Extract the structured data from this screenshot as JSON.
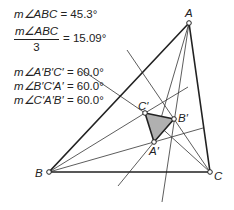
{
  "measurements": {
    "angle_abc": {
      "label": "m∠ABC",
      "value": "= 45.3°"
    },
    "angle_abc_third": {
      "numerator": "m∠ABC",
      "denominator": "3",
      "value": "= 15.09°"
    },
    "angle_a_b_c_prime": {
      "label": "m∠A′B′C′",
      "value": "= 60.0°"
    },
    "angle_b_c_a_prime": {
      "label": "m∠B′C′A′",
      "value": "= 60.0°"
    },
    "angle_c_a_b_prime": {
      "label": "m∠C′A′B′",
      "value": "= 60.0°"
    }
  },
  "points": {
    "A": {
      "label": "A",
      "x": 189,
      "y": 23
    },
    "B": {
      "label": "B",
      "x": 49,
      "y": 172
    },
    "C": {
      "label": "C",
      "x": 210,
      "y": 172
    },
    "A_prime": {
      "label": "A′",
      "x": 154,
      "y": 142
    },
    "B_prime": {
      "label": "B′",
      "x": 174,
      "y": 119
    },
    "C_prime": {
      "label": "C′",
      "x": 145,
      "y": 113
    }
  },
  "colors": {
    "stroke": "#222222",
    "fill_inner": "#b0b0b0"
  }
}
